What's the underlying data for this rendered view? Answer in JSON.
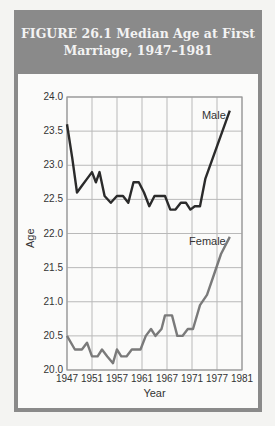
{
  "figure": {
    "title_line1": "FIGURE 26.1   Median Age at First",
    "title_line2": "Marriage, 1947–1981",
    "frame_color": "#8a8a8a",
    "panel_color": "#fbfbfa"
  },
  "chart_data": {
    "type": "line",
    "title": "Median Age at First Marriage, 1947–1981",
    "xlabel": "Year",
    "ylabel": "Age",
    "x_tick_labels": [
      "1947",
      "1951",
      "1957",
      "1961",
      "1967",
      "1971",
      "1977",
      "1981"
    ],
    "y_tick_labels": [
      "20.0",
      "20.5",
      "21.0",
      "21.5",
      "22.0",
      "22.5",
      "23.0",
      "23.5",
      "24.0"
    ],
    "ylim": [
      20.0,
      24.0
    ],
    "grid": true,
    "note": "x positions are fractions (0-1) of the x-axis span from 1947 to 1981; tick labels are evenly spaced",
    "series": [
      {
        "name": "Male",
        "color": "#2b2b2b",
        "label_position": "upper right",
        "points": [
          [
            0.0,
            23.6
          ],
          [
            0.03,
            23.1
          ],
          [
            0.057,
            22.6
          ],
          [
            0.085,
            22.7
          ],
          [
            0.114,
            22.8
          ],
          [
            0.143,
            22.9
          ],
          [
            0.165,
            22.75
          ],
          [
            0.186,
            22.9
          ],
          [
            0.215,
            22.55
          ],
          [
            0.25,
            22.45
          ],
          [
            0.285,
            22.55
          ],
          [
            0.32,
            22.55
          ],
          [
            0.35,
            22.45
          ],
          [
            0.38,
            22.75
          ],
          [
            0.41,
            22.75
          ],
          [
            0.44,
            22.6
          ],
          [
            0.47,
            22.4
          ],
          [
            0.5,
            22.55
          ],
          [
            0.53,
            22.55
          ],
          [
            0.56,
            22.55
          ],
          [
            0.59,
            22.35
          ],
          [
            0.62,
            22.35
          ],
          [
            0.65,
            22.45
          ],
          [
            0.68,
            22.45
          ],
          [
            0.705,
            22.35
          ],
          [
            0.73,
            22.4
          ],
          [
            0.76,
            22.4
          ],
          [
            0.79,
            22.8
          ],
          [
            0.86,
            23.3
          ],
          [
            0.93,
            23.8
          ]
        ]
      },
      {
        "name": "Female",
        "color": "#7a7a7a",
        "label_position": "middle right",
        "points": [
          [
            0.0,
            20.5
          ],
          [
            0.045,
            20.3
          ],
          [
            0.085,
            20.3
          ],
          [
            0.114,
            20.4
          ],
          [
            0.143,
            20.2
          ],
          [
            0.175,
            20.2
          ],
          [
            0.2,
            20.3
          ],
          [
            0.23,
            20.2
          ],
          [
            0.263,
            20.1
          ],
          [
            0.285,
            20.3
          ],
          [
            0.31,
            20.2
          ],
          [
            0.34,
            20.2
          ],
          [
            0.37,
            20.3
          ],
          [
            0.42,
            20.3
          ],
          [
            0.45,
            20.5
          ],
          [
            0.48,
            20.6
          ],
          [
            0.505,
            20.5
          ],
          [
            0.54,
            20.6
          ],
          [
            0.56,
            20.8
          ],
          [
            0.6,
            20.8
          ],
          [
            0.63,
            20.5
          ],
          [
            0.66,
            20.5
          ],
          [
            0.69,
            20.6
          ],
          [
            0.72,
            20.6
          ],
          [
            0.76,
            20.95
          ],
          [
            0.8,
            21.1
          ],
          [
            0.84,
            21.4
          ],
          [
            0.88,
            21.7
          ],
          [
            0.93,
            21.95
          ]
        ]
      }
    ]
  }
}
